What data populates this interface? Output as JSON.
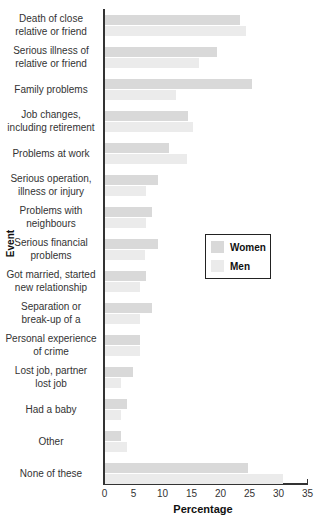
{
  "chart_data": {
    "type": "bar",
    "orientation": "horizontal",
    "title": "",
    "xlabel": "Percentage",
    "ylabel": "Event",
    "xlim": [
      0,
      35
    ],
    "xticks": [
      0,
      5,
      10,
      15,
      20,
      25,
      30,
      35
    ],
    "grid": false,
    "legend_position": "right-center",
    "categories": [
      "Death of close relative or friend",
      "Serious illness of relative or friend",
      "Family problems",
      "Job changes, including retirement",
      "Problems at work",
      "Serious operation, illness or injury",
      "Problems with neighbours",
      "Serious financial problems",
      "Got married, started new relationship",
      "Separation or break-up of a",
      "Personal experience of crime",
      "Lost job, partner lost job",
      "Had a baby",
      "Other",
      "None of these"
    ],
    "series": [
      {
        "name": "Women",
        "color": "#d9d9d9",
        "values": [
          23.5,
          19.5,
          25.5,
          14.5,
          11.2,
          9.3,
          8.3,
          9.3,
          7.2,
          8.3,
          6.2,
          5.0,
          4.0,
          2.9,
          24.8
        ]
      },
      {
        "name": "Men",
        "color": "#ebebeb",
        "values": [
          24.5,
          16.4,
          12.4,
          15.3,
          14.3,
          7.2,
          7.2,
          7.1,
          6.2,
          6.2,
          6.2,
          2.9,
          2.9,
          4.0,
          30.9
        ]
      }
    ]
  },
  "labels": {
    "categories": [
      [
        "Death of close",
        "relative or friend"
      ],
      [
        "Serious illness of",
        "relative or friend"
      ],
      [
        "Family problems"
      ],
      [
        "Job changes,",
        "including retirement"
      ],
      [
        "Problems at work"
      ],
      [
        "Serious operation,",
        "illness or injury"
      ],
      [
        "Problems with",
        "neighbours"
      ],
      [
        "Serious financial",
        "problems"
      ],
      [
        "Got married, started",
        "new relationship"
      ],
      [
        "Separation or",
        "break-up of a"
      ],
      [
        "Personal experience",
        "of crime"
      ],
      [
        "Lost job, partner",
        "lost job"
      ],
      [
        "Had a baby"
      ],
      [
        "Other"
      ],
      [
        "None of these"
      ]
    ],
    "xlabel": "Percentage",
    "ylabel": "Event",
    "legend": {
      "women": "Women",
      "men": "Men"
    }
  }
}
